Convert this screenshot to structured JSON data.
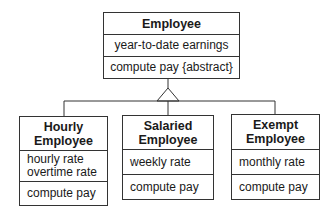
{
  "diagram": {
    "type": "uml-class-inheritance",
    "superclass": {
      "name": "Employee",
      "attributes": [
        "year-to-date earnings"
      ],
      "operations": [
        "compute pay {abstract}"
      ]
    },
    "subclasses": [
      {
        "name_line1": "Hourly",
        "name_line2": "Employee",
        "attributes": [
          "hourly rate",
          "overtime rate"
        ],
        "operations": [
          "compute pay"
        ]
      },
      {
        "name_line1": "Salaried",
        "name_line2": "Employee",
        "attributes": [
          "weekly rate"
        ],
        "operations": [
          "compute pay"
        ]
      },
      {
        "name_line1": "Exempt",
        "name_line2": "Employee",
        "attributes": [
          "monthly rate"
        ],
        "operations": [
          "compute pay"
        ]
      }
    ],
    "relationship": "generalization"
  }
}
